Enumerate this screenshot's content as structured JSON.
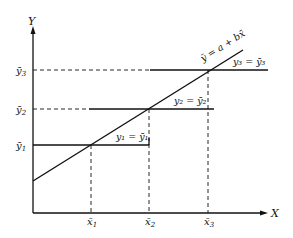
{
  "diagram": {
    "axes": {
      "x_label": "X",
      "y_label": "Y"
    },
    "regression_line": {
      "label": "ȳ = a + bx̄"
    },
    "y_ticks": [
      {
        "label": "ȳ",
        "sub": "1"
      },
      {
        "label": "ȳ",
        "sub": "2"
      },
      {
        "label": "ȳ",
        "sub": "3"
      }
    ],
    "x_ticks": [
      {
        "label": "x̄",
        "sub": "1"
      },
      {
        "label": "x̄",
        "sub": "2"
      },
      {
        "label": "x̄",
        "sub": "3"
      }
    ],
    "horizontal_lines": [
      {
        "label": "y₁ = ȳ₁"
      },
      {
        "label": "y₂ = ȳ₂"
      },
      {
        "label": "y₃ = ȳ₃"
      }
    ],
    "colors": {
      "line": "#111111",
      "background": "#ffffff"
    }
  }
}
